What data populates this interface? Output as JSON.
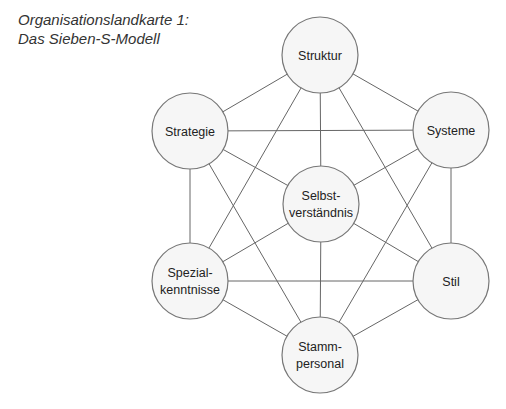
{
  "title": {
    "line1": "Organisationslandkarte 1:",
    "line2": "Das Sieben-S-Modell"
  },
  "nodes": [
    {
      "id": "struktur",
      "lines": [
        "Struktur"
      ],
      "x": 320,
      "y": 55
    },
    {
      "id": "strategie",
      "lines": [
        "Strategie"
      ],
      "x": 190,
      "y": 131
    },
    {
      "id": "systeme",
      "lines": [
        "Systeme"
      ],
      "x": 451,
      "y": 130
    },
    {
      "id": "selbstverstaendnis",
      "lines": [
        "Selbst-",
        "verständnis"
      ],
      "x": 321,
      "y": 204
    },
    {
      "id": "spezialkenntnisse",
      "lines": [
        "Spezial-",
        "kenntnisse"
      ],
      "x": 190,
      "y": 281
    },
    {
      "id": "stil",
      "lines": [
        "Stil"
      ],
      "x": 451,
      "y": 281
    },
    {
      "id": "stammpersonal",
      "lines": [
        "Stamm-",
        "personal"
      ],
      "x": 320,
      "y": 355
    }
  ],
  "node_radius": 38,
  "edges": [
    [
      "struktur",
      "strategie"
    ],
    [
      "struktur",
      "systeme"
    ],
    [
      "struktur",
      "selbstverstaendnis"
    ],
    [
      "struktur",
      "spezialkenntnisse"
    ],
    [
      "struktur",
      "stil"
    ],
    [
      "strategie",
      "systeme"
    ],
    [
      "strategie",
      "selbstverstaendnis"
    ],
    [
      "strategie",
      "spezialkenntnisse"
    ],
    [
      "strategie",
      "stammpersonal"
    ],
    [
      "systeme",
      "selbstverstaendnis"
    ],
    [
      "systeme",
      "stil"
    ],
    [
      "systeme",
      "stammpersonal"
    ],
    [
      "selbstverstaendnis",
      "spezialkenntnisse"
    ],
    [
      "selbstverstaendnis",
      "stil"
    ],
    [
      "selbstverstaendnis",
      "stammpersonal"
    ],
    [
      "spezialkenntnisse",
      "stil"
    ],
    [
      "spezialkenntnisse",
      "stammpersonal"
    ],
    [
      "stil",
      "stammpersonal"
    ]
  ]
}
